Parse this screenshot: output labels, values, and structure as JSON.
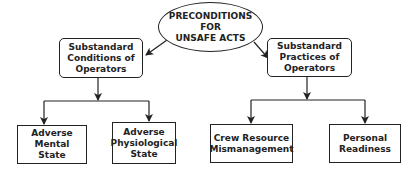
{
  "diagram": {
    "root": {
      "label": "PRECONDITIONS\nFOR\nUNSAFE ACTS"
    },
    "categories": [
      {
        "label": "Substandard\nConditions of\nOperators",
        "children": [
          {
            "label": "Adverse Mental\nState"
          },
          {
            "label": "Adverse\nPhysiological\nState"
          }
        ]
      },
      {
        "label": "Substandard\nPractices of\nOperators",
        "children": [
          {
            "label": "Crew Resource\nMismanagement"
          },
          {
            "label": "Personal\nReadiness"
          }
        ]
      }
    ],
    "colors": {
      "line": "#222222",
      "text": "#222222",
      "background": "#ffffff"
    }
  }
}
